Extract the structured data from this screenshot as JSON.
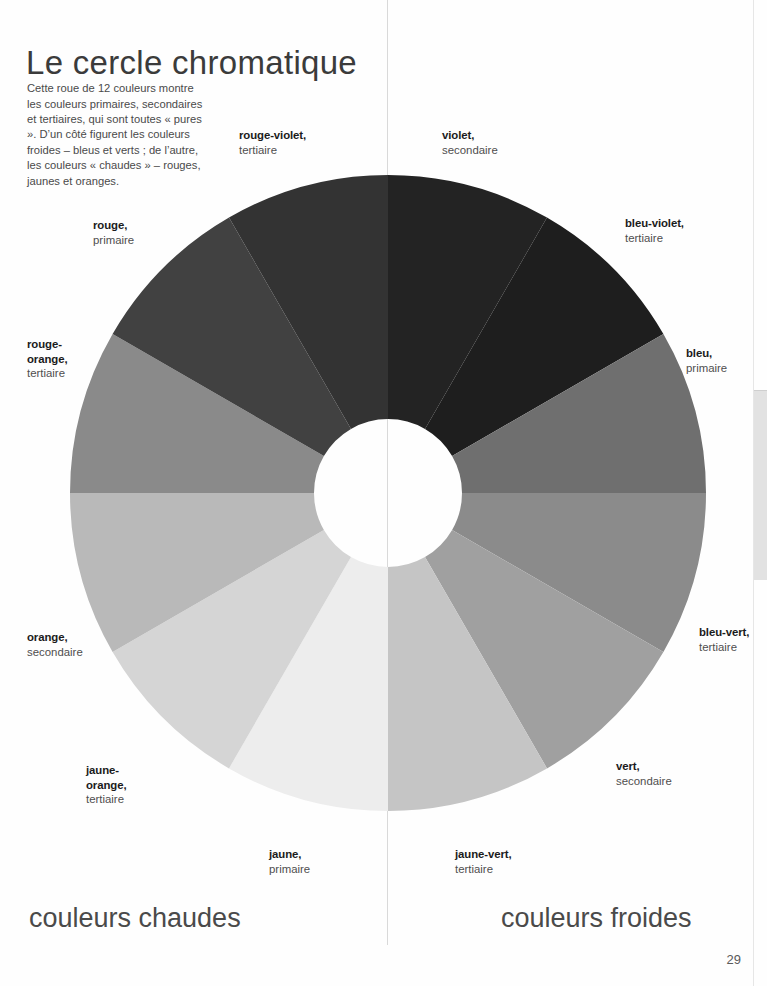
{
  "page": {
    "title": "Le cercle chromatique",
    "intro": "Cette roue de 12 couleurs montre les couleurs primaires, secondaires et tertiaires, qui sont toutes « pures ». D’un côté figurent les couleurs froides – bleus et verts ; de l’autre, les couleurs « chaudes » – rouges, jaunes et oranges.",
    "folio": "29",
    "captions": {
      "warm": "couleurs chaudes",
      "cool": "couleurs froides"
    },
    "divider_color": "#d9d9d9",
    "background_color": "#ffffff"
  },
  "chart_data": {
    "type": "pie",
    "title": "Le cercle chromatique",
    "subtype": "colour-wheel-donut",
    "center": {
      "x": 318,
      "y": 318
    },
    "outer_radius": 318,
    "inner_radius": 74,
    "segment_count": 12,
    "segment_angle_deg": 30,
    "legend": "labels placed radially outside the wheel",
    "categories": [
      "violet",
      "bleu-violet",
      "bleu",
      "bleu-vert",
      "vert",
      "jaune-vert",
      "jaune",
      "jaune-orange",
      "orange",
      "rouge-orange",
      "rouge",
      "rouge-violet"
    ],
    "values": [
      30,
      30,
      30,
      30,
      30,
      30,
      30,
      30,
      30,
      30,
      30,
      30
    ],
    "segments": [
      {
        "name": "violet",
        "type": "secondaire",
        "color": "#232323",
        "start_deg": 0,
        "end_deg": 30,
        "side": "froide"
      },
      {
        "name": "bleu-violet",
        "type": "tertiaire",
        "color": "#1e1e1e",
        "start_deg": 30,
        "end_deg": 60,
        "side": "froide"
      },
      {
        "name": "bleu",
        "type": "primaire",
        "color": "#6f6f6f",
        "start_deg": 60,
        "end_deg": 90,
        "side": "froide"
      },
      {
        "name": "bleu-vert",
        "type": "tertiaire",
        "color": "#8b8b8b",
        "start_deg": 90,
        "end_deg": 120,
        "side": "froide"
      },
      {
        "name": "vert",
        "type": "secondaire",
        "color": "#a0a0a0",
        "start_deg": 120,
        "end_deg": 150,
        "side": "froide"
      },
      {
        "name": "jaune-vert",
        "type": "tertiaire",
        "color": "#c5c5c5",
        "start_deg": 150,
        "end_deg": 180,
        "side": "froide"
      },
      {
        "name": "jaune",
        "type": "primaire",
        "color": "#ededed",
        "start_deg": 180,
        "end_deg": 210,
        "side": "chaude"
      },
      {
        "name": "jaune-orange",
        "type": "tertiaire",
        "color": "#d5d5d5",
        "start_deg": 210,
        "end_deg": 240,
        "side": "chaude"
      },
      {
        "name": "orange",
        "type": "secondaire",
        "color": "#b9b9b9",
        "start_deg": 240,
        "end_deg": 270,
        "side": "chaude"
      },
      {
        "name": "rouge-orange",
        "type": "tertiaire",
        "color": "#8a8a8a",
        "start_deg": 270,
        "end_deg": 300,
        "side": "chaude"
      },
      {
        "name": "rouge",
        "type": "primaire",
        "color": "#414141",
        "start_deg": 300,
        "end_deg": 330,
        "side": "chaude"
      },
      {
        "name": "rouge-violet",
        "type": "tertiaire",
        "color": "#333333",
        "start_deg": 330,
        "end_deg": 360,
        "side": "chaude"
      }
    ]
  },
  "labels": {
    "rouge_violet": {
      "name": "rouge-violet,",
      "type": "tertiaire"
    },
    "violet": {
      "name": "violet,",
      "type": "secondaire"
    },
    "rouge": {
      "name": "rouge,",
      "type": "primaire"
    },
    "bleu_violet": {
      "name": "bleu-violet,",
      "type": "tertiaire"
    },
    "rouge_orange": {
      "name": "rouge-\norange,",
      "name_line1": "rouge-",
      "name_line2": "orange,",
      "type": "tertiaire"
    },
    "bleu": {
      "name": "bleu,",
      "type": "primaire"
    },
    "orange": {
      "name": "orange,",
      "type": "secondaire"
    },
    "bleu_vert": {
      "name": "bleu-vert,",
      "type": "tertiaire"
    },
    "jaune_orange": {
      "name_line1": "jaune-",
      "name_line2": "orange,",
      "type": "tertiaire"
    },
    "vert": {
      "name": "vert,",
      "type": "secondaire"
    },
    "jaune": {
      "name": "jaune,",
      "type": "primaire"
    },
    "jaune_vert": {
      "name": "jaune-vert,",
      "type": "tertiaire"
    }
  }
}
